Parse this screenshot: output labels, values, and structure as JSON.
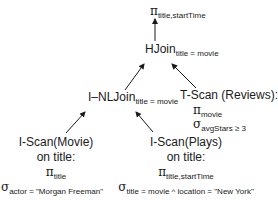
{
  "diagram": {
    "type": "query-execution-plan",
    "root": {
      "symbol": "π",
      "subscript": "title,startTime"
    },
    "hjoin": {
      "label": "HJoin",
      "subscript": "title = movie"
    },
    "nljoin": {
      "label": "I–NLJoin",
      "subscript": "title = movie"
    },
    "reviews": {
      "label": "T-Scan (Reviews):",
      "proj_symbol": "π",
      "proj_sub": "movie",
      "sel_symbol": "σ",
      "sel_sub": "avgStars ≥ 3"
    },
    "movie": {
      "line1": "I-Scan(Movie)",
      "line2": "on title:",
      "proj_symbol": "π",
      "proj_sub": "title",
      "sel_symbol": "σ",
      "sel_sub": "actor = \"Morgan Freeman\""
    },
    "plays": {
      "line1": "I-Scan(Plays)",
      "line2": "on title:",
      "proj_symbol": "π",
      "proj_sub": "title,startTime",
      "sel_symbol": "σ",
      "sel_sub": "title = movie ^ location = \"New York\""
    },
    "edges": [
      {
        "from": "hjoin",
        "to": "root"
      },
      {
        "from": "nljoin",
        "to": "hjoin"
      },
      {
        "from": "reviews",
        "to": "hjoin"
      },
      {
        "from": "movie",
        "to": "nljoin"
      },
      {
        "from": "plays",
        "to": "nljoin"
      }
    ],
    "colors": {
      "ink": "#1a1a1a",
      "background": "#ffffff"
    }
  }
}
